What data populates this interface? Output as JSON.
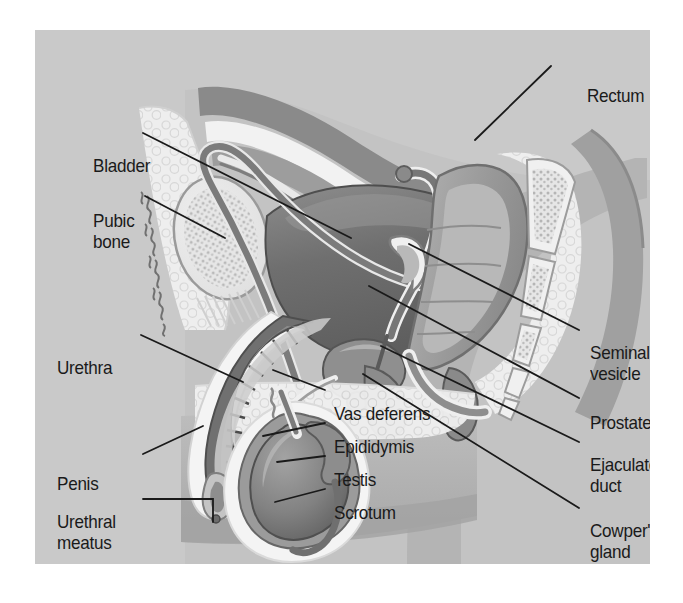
{
  "figure": {
    "background_color": "#c9c9c9",
    "page_color": "#ffffff",
    "label_color": "#1a1a1a",
    "leader_line_color": "#1a1a1a"
  },
  "labels": [
    {
      "id": "rectum",
      "text": "Rectum",
      "x": 552,
      "y": 55,
      "align": "left"
    },
    {
      "id": "bladder",
      "text": "Bladder",
      "x": 58,
      "y": 125,
      "align": "left"
    },
    {
      "id": "pubic-bone",
      "text": "Pubic\nbone",
      "x": 58,
      "y": 180,
      "align": "left"
    },
    {
      "id": "urethra",
      "text": "Urethra",
      "x": 60,
      "y": 327,
      "align": "left"
    },
    {
      "id": "penis",
      "text": "Penis",
      "x": 60,
      "y": 443,
      "align": "left"
    },
    {
      "id": "urethral-meatus",
      "text": "Urethral\nmeatus",
      "x": 60,
      "y": 481,
      "align": "left"
    },
    {
      "id": "vas-deferens",
      "text": "Vas deferens",
      "x": 299,
      "y": 373,
      "align": "left"
    },
    {
      "id": "epididymis",
      "text": "Epididymis",
      "x": 299,
      "y": 406,
      "align": "left"
    },
    {
      "id": "testis",
      "text": "Testis",
      "x": 299,
      "y": 439,
      "align": "left"
    },
    {
      "id": "scrotum",
      "text": "Scrotum",
      "x": 299,
      "y": 472,
      "align": "left"
    },
    {
      "id": "seminal-vesicle",
      "text": "Seminal\nvesicle",
      "x": 555,
      "y": 312,
      "align": "left"
    },
    {
      "id": "prostate",
      "text": "Prostate",
      "x": 555,
      "y": 382,
      "align": "left"
    },
    {
      "id": "ejaculatory-duct",
      "text": "Ejaculatory\nduct",
      "x": 555,
      "y": 424,
      "align": "left"
    },
    {
      "id": "cowpers-gland",
      "text": "Cowper's\ngland",
      "x": 555,
      "y": 490,
      "align": "left"
    }
  ],
  "anatomy_parts": [
    {
      "id": "bladder",
      "name": "Bladder"
    },
    {
      "id": "pubic-bone",
      "name": "Pubic bone"
    },
    {
      "id": "rectum",
      "name": "Rectum"
    },
    {
      "id": "sacrum",
      "name": "Sacrum / coccyx"
    },
    {
      "id": "urethra",
      "name": "Urethra"
    },
    {
      "id": "penis",
      "name": "Penis"
    },
    {
      "id": "urethral-meatus",
      "name": "Urethral meatus"
    },
    {
      "id": "vas-deferens",
      "name": "Vas deferens"
    },
    {
      "id": "epididymis",
      "name": "Epididymis"
    },
    {
      "id": "testis",
      "name": "Testis"
    },
    {
      "id": "scrotum",
      "name": "Scrotum"
    },
    {
      "id": "seminal-vesicle",
      "name": "Seminal vesicle"
    },
    {
      "id": "prostate",
      "name": "Prostate"
    },
    {
      "id": "ejaculatory-duct",
      "name": "Ejaculatory duct"
    },
    {
      "id": "cowpers-gland",
      "name": "Cowper's gland"
    },
    {
      "id": "abdominal-wall",
      "name": "Abdominal wall"
    },
    {
      "id": "thigh",
      "name": "Thigh / body outline"
    },
    {
      "id": "buttock",
      "name": "Buttock outline"
    }
  ]
}
